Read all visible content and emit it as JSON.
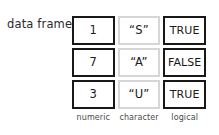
{
  "diagram": {
    "caption": "data frame",
    "columns": [
      {
        "type_label": "numeric",
        "border": "dark",
        "border_color": "#181818"
      },
      {
        "type_label": "character",
        "border": "light",
        "border_color": "#d6d6d6"
      },
      {
        "type_label": "logical",
        "border": "dark",
        "border_color": "#181818"
      }
    ],
    "rows": [
      {
        "numeric": "1",
        "character": "“S”",
        "logical": "TRUE"
      },
      {
        "numeric": "7",
        "character": "“A”",
        "logical": "FALSE"
      },
      {
        "numeric": "3",
        "character": "“U”",
        "logical": "TRUE"
      }
    ],
    "background": "#ffffff",
    "text_color": "#1a1a1a",
    "label_color": "#4a4a4a"
  }
}
